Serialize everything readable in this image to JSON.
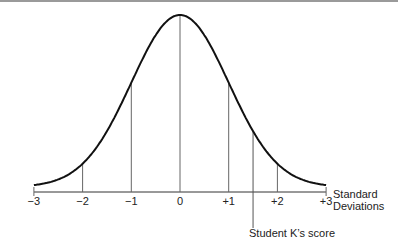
{
  "chart_data": {
    "type": "line",
    "xlabel": "Standard Deviations",
    "x_ticks": [
      -3,
      -2,
      -1,
      0,
      1,
      2,
      3
    ],
    "tick_labels": [
      "−3",
      "−2",
      "−1",
      "0",
      "+1",
      "+2",
      "+3"
    ],
    "xlim": [
      -3,
      3
    ],
    "annotations": [
      {
        "text": "Student K's score",
        "x": 1.5
      }
    ],
    "vertical_lines_at": [
      -2,
      -1,
      0,
      1,
      2,
      1.5
    ],
    "grid": false
  },
  "axis": {
    "label_line1": "Standard",
    "label_line2": "Deviations"
  },
  "annotation": {
    "student_score": "Student K’s score"
  }
}
